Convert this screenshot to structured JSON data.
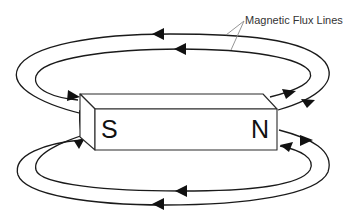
{
  "diagram": {
    "annotation": "Magnetic Flux Lines",
    "magnet": {
      "south_label": "S",
      "north_label": "N"
    },
    "flux_lines": [
      {
        "name": "outer-top",
        "direction": "N to S (right to left over top)"
      },
      {
        "name": "inner-top",
        "direction": "N to S (right to left over top)"
      },
      {
        "name": "inner-bottom",
        "direction": "N to S (right to left under bottom)"
      },
      {
        "name": "outer-bottom",
        "direction": "N to S (right to left under bottom)"
      }
    ],
    "colors": {
      "line": "#1a1a1a",
      "leader": "#8a8a8a",
      "background": "#ffffff"
    }
  }
}
